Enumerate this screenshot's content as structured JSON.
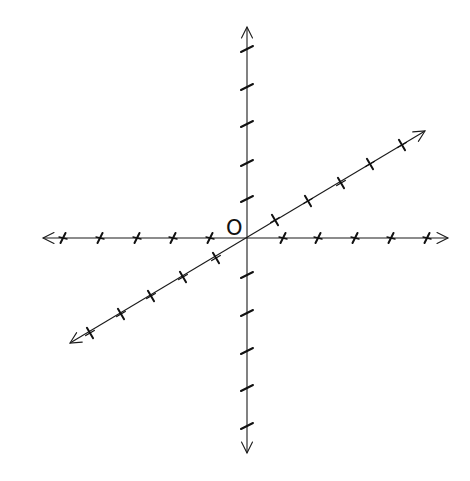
{
  "diagram": {
    "origin_label": "O",
    "colors": {
      "line": "#1a1a1a",
      "background": "#ffffff"
    },
    "origin": [
      247,
      238
    ],
    "axes": [
      {
        "name": "horizontal-axis",
        "from": [
          43,
          238
        ],
        "to": [
          448,
          238
        ],
        "arrows": [
          "both"
        ],
        "ticks": [
          [
            63,
            238
          ],
          [
            100,
            238
          ],
          [
            137,
            238
          ],
          [
            173,
            238
          ],
          [
            210,
            238
          ],
          [
            283,
            238
          ],
          [
            318,
            238
          ],
          [
            355,
            238
          ],
          [
            391,
            238
          ],
          [
            427,
            238
          ]
        ]
      },
      {
        "name": "vertical-axis",
        "from": [
          247,
          27
        ],
        "to": [
          247,
          453
        ],
        "arrows": [
          "both"
        ],
        "ticks": [
          [
            247,
            49
          ],
          [
            247,
            87
          ],
          [
            247,
            124
          ],
          [
            247,
            163
          ],
          [
            247,
            199
          ],
          [
            247,
            275
          ],
          [
            247,
            313
          ],
          [
            247,
            351
          ],
          [
            247,
            388
          ],
          [
            247,
            426
          ]
        ]
      },
      {
        "name": "oblique-axis",
        "from": [
          70,
          343
        ],
        "to": [
          425,
          131
        ],
        "arrows": [
          "both"
        ],
        "ticks": [
          [
            90,
            333
          ],
          [
            121,
            314
          ],
          [
            151,
            296
          ],
          [
            183,
            277
          ],
          [
            216,
            258
          ],
          [
            275,
            220
          ],
          [
            308,
            201
          ],
          [
            341,
            183
          ],
          [
            370,
            164
          ],
          [
            402,
            145
          ]
        ]
      }
    ],
    "tick_count_per_half_axis": 5
  }
}
